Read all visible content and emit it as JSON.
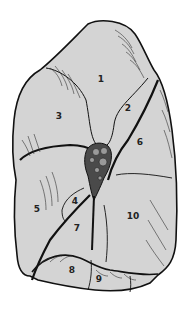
{
  "figure": {
    "type": "anatomical-diagram",
    "colors": {
      "fill": "#d4d4d4",
      "outline": "#111111",
      "hilum": "#4a4a4a",
      "vessel": "#9a9a9a",
      "background": "#ffffff"
    },
    "labels": [
      {
        "id": "1",
        "text": "1",
        "x": 101,
        "y": 82
      },
      {
        "id": "2",
        "text": "2",
        "x": 128,
        "y": 111
      },
      {
        "id": "3",
        "text": "3",
        "x": 59,
        "y": 119
      },
      {
        "id": "4",
        "text": "4",
        "x": 75,
        "y": 204
      },
      {
        "id": "5",
        "text": "5",
        "x": 37,
        "y": 212
      },
      {
        "id": "6",
        "text": "6",
        "x": 140,
        "y": 145
      },
      {
        "id": "7",
        "text": "7",
        "x": 77,
        "y": 231
      },
      {
        "id": "8",
        "text": "8",
        "x": 72,
        "y": 273
      },
      {
        "id": "9",
        "text": "9",
        "x": 99,
        "y": 282
      },
      {
        "id": "10",
        "text": "10",
        "x": 133,
        "y": 219
      }
    ]
  }
}
